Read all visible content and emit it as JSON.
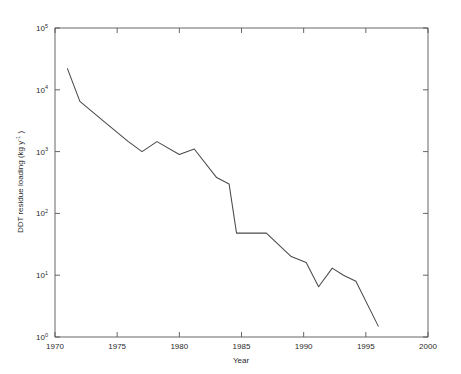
{
  "chart_data": {
    "type": "line",
    "title": "",
    "xlabel": "Year",
    "ylabel": "DDT residue loading (kg y-1 )",
    "ylabel_parts": {
      "text_before": "DDT residue loading (kg y",
      "exponent": "-1",
      "text_after": " )"
    },
    "xlim": [
      1970,
      2000
    ],
    "ylim": [
      1,
      100000
    ],
    "yscale": "log",
    "xscale": "linear",
    "grid": false,
    "legend": null,
    "xticks": [
      1970,
      1975,
      1980,
      1985,
      1990,
      1995,
      2000
    ],
    "xticklabels": [
      "1970",
      "1975",
      "1980",
      "1985",
      "1990",
      "1995",
      "2000"
    ],
    "yticks": [
      1,
      10,
      100,
      1000,
      10000,
      100000
    ],
    "yticklabels": [
      "10^0",
      "10^1",
      "10^2",
      "10^3",
      "10^4",
      "10^5"
    ],
    "ytick_mantissa": "10",
    "ytick_exponents": [
      "0",
      "1",
      "2",
      "3",
      "4",
      "5"
    ],
    "series": [
      {
        "name": "DDT residue loading",
        "color": "#4a4a4a",
        "x": [
          1971.0,
          1972.0,
          1974.0,
          1975.9,
          1977.0,
          1978.2,
          1980.0,
          1981.2,
          1983.0,
          1984.0,
          1984.6,
          1987.0,
          1989.0,
          1990.2,
          1991.2,
          1992.3,
          1993.2,
          1994.2,
          1996.0
        ],
        "y": [
          22000,
          6500,
          3000,
          1450,
          1000,
          1450,
          900,
          1100,
          380,
          300,
          48,
          48,
          20,
          16,
          6.5,
          13,
          10,
          8,
          1.5
        ]
      }
    ]
  },
  "figure": {
    "background_color": "#ffffff",
    "axis_color": "#555555",
    "line_color": "#4a4a4a"
  }
}
